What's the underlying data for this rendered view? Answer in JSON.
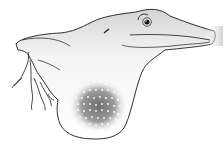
{
  "illustration": {
    "subject": "Lizard (anole) with extended throat dewlap",
    "style": "black line drawing with grey shading",
    "colors": {
      "background": "#ffffff",
      "outline": "#1a1a1a",
      "shade": "#c8c8c8",
      "dewlap_dark": "#6e6e6e",
      "dewlap_dots": "#ffffff"
    }
  }
}
